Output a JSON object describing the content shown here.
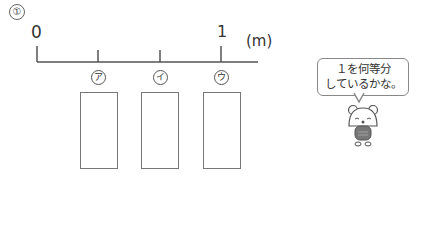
{
  "problem": {
    "number": "①"
  },
  "number_line": {
    "start_label": "0",
    "end_label": "1",
    "unit": "(m)",
    "divisions": 4,
    "point_labels": [
      "ア",
      "イ",
      "ウ"
    ]
  },
  "answer_boxes": [
    {
      "label": "ア",
      "value": ""
    },
    {
      "label": "イ",
      "value": ""
    },
    {
      "label": "ウ",
      "value": ""
    }
  ],
  "speech_bubble": {
    "line1": "１を何等分",
    "line2": "しているかな。",
    "ruby": "とう"
  },
  "colors": {
    "line": "#555555",
    "text": "#333333"
  }
}
